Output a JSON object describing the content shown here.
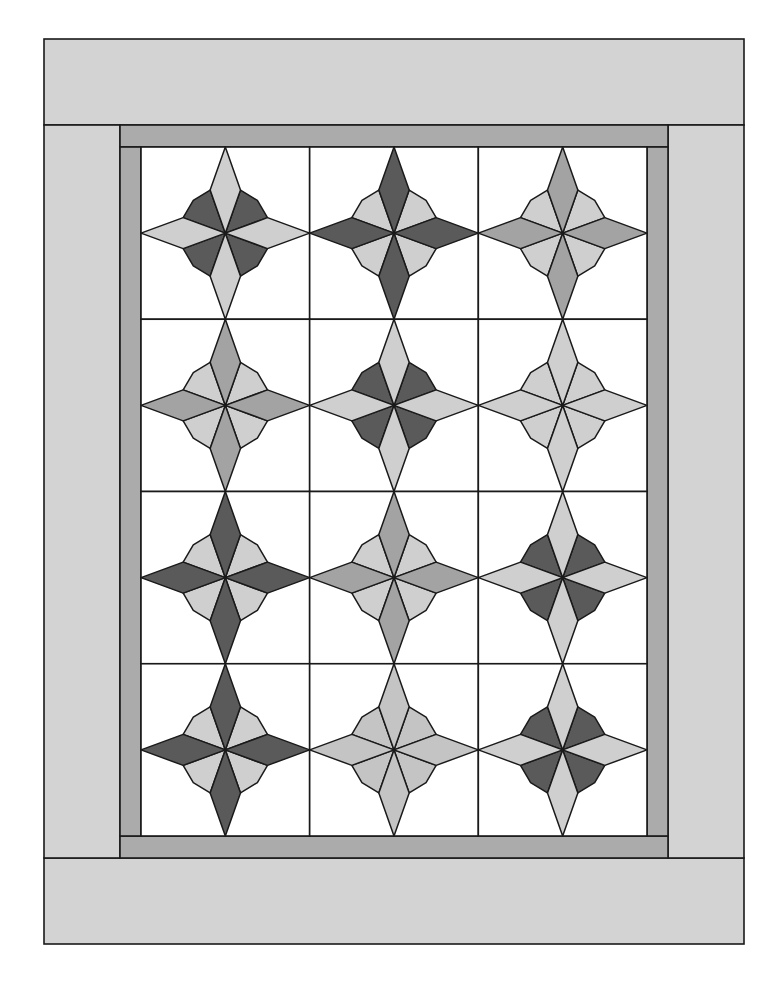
{
  "diagram": {
    "type": "quilt-layout",
    "grid": {
      "rows": 4,
      "cols": 3
    },
    "colors": {
      "background": "#ffffff",
      "outer_border": "#d3d3d3",
      "inner_frame": "#ababab",
      "block_background": "#ffffff",
      "outline": "#1a1a1a",
      "dark": "#5a5a5a",
      "medium": "#a3a3a3",
      "light": "#cfcfcf",
      "pale": "#c4c4c4"
    },
    "blocks": [
      {
        "row": 1,
        "col": 1,
        "arms": "light",
        "diagonals": "dark"
      },
      {
        "row": 1,
        "col": 2,
        "arms": "dark",
        "diagonals": "light"
      },
      {
        "row": 1,
        "col": 3,
        "arms": "medium",
        "diagonals": "light"
      },
      {
        "row": 2,
        "col": 1,
        "arms": "medium",
        "diagonals": "light"
      },
      {
        "row": 2,
        "col": 2,
        "arms": "light",
        "diagonals": "dark"
      },
      {
        "row": 2,
        "col": 3,
        "arms": "light",
        "diagonals": "light"
      },
      {
        "row": 3,
        "col": 1,
        "arms": "dark",
        "diagonals": "light"
      },
      {
        "row": 3,
        "col": 2,
        "arms": "medium",
        "diagonals": "light"
      },
      {
        "row": 3,
        "col": 3,
        "arms": "light",
        "diagonals": "dark"
      },
      {
        "row": 4,
        "col": 1,
        "arms": "dark",
        "diagonals": "light"
      },
      {
        "row": 4,
        "col": 2,
        "arms": "pale",
        "diagonals": "pale"
      },
      {
        "row": 4,
        "col": 3,
        "arms": "light",
        "diagonals": "dark"
      }
    ]
  }
}
